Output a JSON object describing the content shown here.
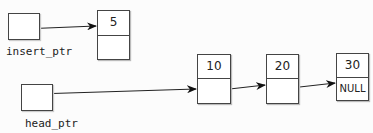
{
  "pointers": [
    {
      "label": "insert_ptr"
    },
    {
      "label": "head_ptr"
    }
  ],
  "nodes": [
    {
      "value": "5",
      "next": ""
    },
    {
      "value": "10",
      "next": ""
    },
    {
      "value": "20",
      "next": ""
    },
    {
      "value": "30",
      "next": "NULL"
    }
  ]
}
